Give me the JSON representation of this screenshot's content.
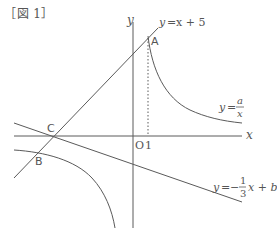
{
  "figure": {
    "label": "［図 1］"
  },
  "axes": {
    "x_label": "x",
    "y_label": "y",
    "origin_label": "O",
    "tick_label": "1"
  },
  "points": {
    "A": "A",
    "B": "B",
    "C": "C"
  },
  "curves": {
    "line1": {
      "lhs": "y",
      "eq": "=",
      "rhs": "x + 5"
    },
    "hyperbola": {
      "lhs": "y",
      "eq": "=",
      "num": "a",
      "den": "x"
    },
    "line2": {
      "lhs": "y",
      "eq": "=",
      "sign": "−",
      "num": "1",
      "den": "3",
      "rest": "x + b"
    }
  },
  "colors": {
    "stroke": "#5a5a5a",
    "text": "#555555"
  }
}
